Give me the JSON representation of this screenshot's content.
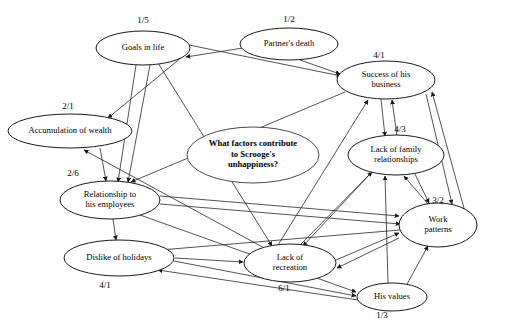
{
  "diagram": {
    "type": "concept-map",
    "background_color": "#ffffff",
    "node_fill": "#ffffff",
    "center_node_fill": "#808080",
    "line_color": "#1a1a1a"
  },
  "center_node": {
    "id": "center",
    "lines": [
      "What factors contribute",
      "to Scrooge's",
      "unhappiness?"
    ],
    "cx": 253,
    "cy": 155,
    "rx": 66,
    "ry": 28,
    "fill": "#808080"
  },
  "nodes": [
    {
      "id": "goals",
      "lines": [
        "Goals in life"
      ],
      "ratio": "1/5",
      "cx": 143,
      "cy": 48,
      "rx": 47,
      "ry": 17,
      "ratio_x": 143,
      "ratio_y": 21
    },
    {
      "id": "partner",
      "lines": [
        "Partner's death"
      ],
      "ratio": "1/2",
      "cx": 289,
      "cy": 44,
      "rx": 49,
      "ry": 16,
      "ratio_x": 289,
      "ratio_y": 20
    },
    {
      "id": "success",
      "lines": [
        "Success of his",
        "business"
      ],
      "ratio": "4/1",
      "cx": 386,
      "cy": 80,
      "rx": 49,
      "ry": 19,
      "ratio_x": 379,
      "ratio_y": 56
    },
    {
      "id": "wealth",
      "lines": [
        "Accumulation of wealth"
      ],
      "ratio": "2/1",
      "cx": 70,
      "cy": 131,
      "rx": 62,
      "ry": 17,
      "ratio_x": 68,
      "ratio_y": 107
    },
    {
      "id": "family",
      "lines": [
        "Lack of family",
        "relationships"
      ],
      "ratio": "4/3",
      "cx": 396,
      "cy": 155,
      "rx": 48,
      "ry": 20,
      "ratio_x": 400,
      "ratio_y": 130
    },
    {
      "id": "employees",
      "lines": [
        "Relationship to",
        "his employees"
      ],
      "ratio": "2/6",
      "cx": 110,
      "cy": 200,
      "rx": 50,
      "ry": 19,
      "ratio_x": 73,
      "ratio_y": 174
    },
    {
      "id": "work",
      "lines": [
        "Work",
        "patterns"
      ],
      "ratio": "3/2",
      "cx": 438,
      "cy": 225,
      "rx": 39,
      "ry": 22,
      "ratio_x": 438,
      "ratio_y": 201
    },
    {
      "id": "holidays",
      "lines": [
        "Dislike of holidays"
      ],
      "ratio": "4/1",
      "cx": 119,
      "cy": 258,
      "rx": 55,
      "ry": 18,
      "ratio_x": 105,
      "ratio_y": 286
    },
    {
      "id": "recreation",
      "lines": [
        "Lack of",
        "recreation"
      ],
      "ratio": "6/1",
      "cx": 290,
      "cy": 263,
      "rx": 46,
      "ry": 19,
      "ratio_x": 284,
      "ratio_y": 289
    },
    {
      "id": "values",
      "lines": [
        "His values"
      ],
      "ratio": "1/3",
      "cx": 392,
      "cy": 297,
      "rx": 35,
      "ry": 14,
      "ratio_x": 382,
      "ratio_y": 316
    }
  ],
  "edges": [
    {
      "from": "goals",
      "to": "wealth",
      "x1": 182,
      "y1": 57,
      "x2": 108,
      "y2": 118
    },
    {
      "from": "partner",
      "to": "goals",
      "x1": 243,
      "y1": 48,
      "x2": 186,
      "y2": 57
    },
    {
      "from": "partner",
      "to": "success",
      "x1": 300,
      "y1": 60,
      "x2": 340,
      "y2": 74
    },
    {
      "from": "goals",
      "to": "success",
      "x1": 189,
      "y1": 45,
      "x2": 341,
      "y2": 76
    },
    {
      "from": "goals",
      "to": "employees",
      "x1": 136,
      "y1": 65,
      "x2": 118,
      "y2": 182
    },
    {
      "from": "goals",
      "to": "employees2",
      "x1": 150,
      "y1": 65,
      "x2": 128,
      "y2": 182
    },
    {
      "from": "goals",
      "to": "recreation",
      "x1": 158,
      "y1": 63,
      "x2": 272,
      "y2": 246
    },
    {
      "from": "success",
      "to": "family",
      "x1": 381,
      "y1": 99,
      "x2": 385,
      "y2": 136
    },
    {
      "from": "family",
      "to": "success",
      "x1": 397,
      "y1": 136,
      "x2": 392,
      "y2": 100
    },
    {
      "from": "success",
      "to": "work",
      "x1": 426,
      "y1": 94,
      "x2": 452,
      "y2": 204
    },
    {
      "from": "work",
      "to": "success",
      "x1": 465,
      "y1": 212,
      "x2": 432,
      "y2": 92
    },
    {
      "from": "family",
      "to": "work",
      "x1": 414,
      "y1": 172,
      "x2": 429,
      "y2": 203
    },
    {
      "from": "work",
      "to": "family",
      "x1": 428,
      "y1": 204,
      "x2": 404,
      "y2": 176
    },
    {
      "from": "values",
      "to": "family",
      "x1": 388,
      "y1": 283,
      "x2": 385,
      "y2": 176
    },
    {
      "from": "values",
      "to": "work",
      "x1": 406,
      "y1": 286,
      "x2": 428,
      "y2": 246
    },
    {
      "from": "employees",
      "to": "holidays",
      "x1": 113,
      "y1": 219,
      "x2": 116,
      "y2": 240
    },
    {
      "from": "employees",
      "to": "work",
      "x1": 160,
      "y1": 196,
      "x2": 399,
      "y2": 216
    },
    {
      "from": "employees",
      "to": "recreation",
      "x1": 160,
      "y1": 204,
      "x2": 400,
      "y2": 224
    },
    {
      "from": "holidays",
      "to": "values",
      "x1": 174,
      "y1": 261,
      "x2": 356,
      "y2": 296
    },
    {
      "from": "recreation",
      "to": "work",
      "x1": 336,
      "y1": 260,
      "x2": 399,
      "y2": 233
    },
    {
      "from": "work",
      "to": "recreation",
      "x1": 399,
      "y1": 238,
      "x2": 337,
      "y2": 268
    },
    {
      "from": "holidays",
      "to": "recreation",
      "x1": 175,
      "y1": 258,
      "x2": 243,
      "y2": 262
    },
    {
      "from": "recreation",
      "to": "family",
      "x1": 300,
      "y1": 245,
      "x2": 372,
      "y2": 172
    },
    {
      "from": "family",
      "to": "recreation",
      "x1": 370,
      "y1": 174,
      "x2": 303,
      "y2": 246
    },
    {
      "from": "wealth",
      "to": "employees",
      "x1": 100,
      "y1": 148,
      "x2": 106,
      "y2": 181
    },
    {
      "from": "success",
      "to": "employees",
      "x1": 345,
      "y1": 92,
      "x2": 131,
      "y2": 182
    },
    {
      "from": "recreation",
      "to": "wealth",
      "x1": 268,
      "y1": 250,
      "x2": 84,
      "y2": 150
    },
    {
      "from": "values",
      "to": "holidays",
      "x1": 358,
      "y1": 300,
      "x2": 158,
      "y2": 270
    },
    {
      "from": "work",
      "to": "holidays",
      "x1": 400,
      "y1": 230,
      "x2": 160,
      "y2": 250
    },
    {
      "from": "recreation",
      "to": "success",
      "x1": 278,
      "y1": 245,
      "x2": 368,
      "y2": 100
    },
    {
      "from": "employees",
      "to": "values",
      "x1": 140,
      "y1": 215,
      "x2": 356,
      "y2": 292
    }
  ]
}
